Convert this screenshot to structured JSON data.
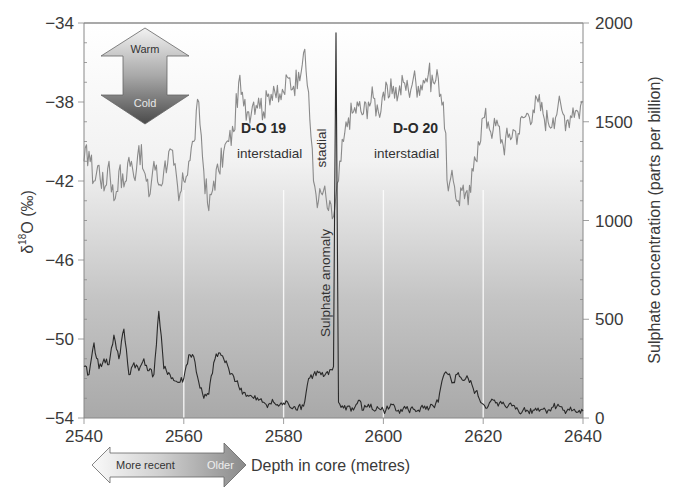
{
  "chart_data": {
    "type": "line",
    "title": "",
    "xlabel": "Depth in core (metres)",
    "ylabel": "δ18O (‰)",
    "ylabel_right": "Sulphate concentration (parts per billion)",
    "xlim": [
      2540,
      2640
    ],
    "ylim": [
      -54,
      -34
    ],
    "ylim_right": [
      0,
      2000
    ],
    "x_ticks": [
      2540,
      2560,
      2580,
      2600,
      2620,
      2640
    ],
    "y_ticks": [
      -34,
      -38,
      -42,
      -46,
      -50,
      -54
    ],
    "y_ticks_right": [
      0,
      500,
      1000,
      1500,
      2000
    ],
    "grid": "vertical white lines at 2560, 2580, 2600, 2620 (lower part)",
    "background": "vertical gradient white (top) to grey (bottom)",
    "series": [
      {
        "name": "δ18O",
        "axis": "left",
        "color": "#8a8a8a",
        "x": [
          2540,
          2541,
          2542,
          2543,
          2544,
          2545,
          2546,
          2547,
          2548,
          2549,
          2550,
          2551,
          2552,
          2553,
          2554,
          2555,
          2556,
          2557,
          2558,
          2559,
          2560,
          2561,
          2562,
          2563,
          2564,
          2565,
          2566,
          2567,
          2568,
          2569,
          2570,
          2571,
          2572,
          2573,
          2574,
          2575,
          2576,
          2577,
          2578,
          2579,
          2580,
          2581,
          2582,
          2583,
          2584,
          2585,
          2586,
          2587,
          2588,
          2589,
          2590,
          2591,
          2592,
          2593,
          2594,
          2595,
          2596,
          2597,
          2598,
          2599,
          2600,
          2601,
          2602,
          2603,
          2604,
          2605,
          2606,
          2607,
          2608,
          2609,
          2610,
          2611,
          2612,
          2613,
          2614,
          2615,
          2616,
          2617,
          2618,
          2619,
          2620,
          2621,
          2622,
          2623,
          2624,
          2625,
          2626,
          2627,
          2628,
          2629,
          2630,
          2631,
          2632,
          2633,
          2634,
          2635,
          2636,
          2637,
          2638,
          2639,
          2640
        ],
        "values": [
          -41.0,
          -40.5,
          -42.0,
          -41.2,
          -42.5,
          -41.0,
          -43.0,
          -41.5,
          -42.3,
          -40.8,
          -41.8,
          -40.2,
          -41.5,
          -42.8,
          -41.0,
          -42.2,
          -41.5,
          -40.5,
          -41.2,
          -43.0,
          -42.0,
          -41.0,
          -40.0,
          -38.0,
          -41.5,
          -43.5,
          -42.0,
          -41.5,
          -40.5,
          -40.0,
          -39.5,
          -37.0,
          -38.2,
          -38.5,
          -38.0,
          -37.8,
          -38.5,
          -37.6,
          -37.2,
          -38.0,
          -37.5,
          -36.8,
          -37.2,
          -36.5,
          -35.5,
          -37.5,
          -42.0,
          -43.0,
          -42.5,
          -43.5,
          -43.8,
          -42.0,
          -40.0,
          -38.8,
          -38.5,
          -38.2,
          -38.6,
          -38.0,
          -37.8,
          -38.5,
          -37.5,
          -37.8,
          -37.2,
          -37.6,
          -37.0,
          -37.4,
          -36.8,
          -37.2,
          -36.9,
          -36.6,
          -37.0,
          -36.8,
          -38.0,
          -42.5,
          -42.0,
          -43.0,
          -42.2,
          -43.2,
          -41.5,
          -40.0,
          -38.8,
          -39.0,
          -39.4,
          -39.2,
          -40.2,
          -39.8,
          -39.4,
          -39.6,
          -38.8,
          -38.6,
          -38.4,
          -38.0,
          -38.6,
          -39.0,
          -38.8,
          -38.2,
          -38.6,
          -38.9,
          -38.3,
          -38.5,
          -38.0
        ]
      },
      {
        "name": "Sulphate",
        "axis": "right",
        "color": "#2a2a2a",
        "x": [
          2540,
          2541,
          2542,
          2543,
          2544,
          2545,
          2546,
          2547,
          2548,
          2549,
          2550,
          2551,
          2552,
          2553,
          2554,
          2555,
          2556,
          2557,
          2558,
          2559,
          2560,
          2561,
          2562,
          2563,
          2564,
          2565,
          2566,
          2567,
          2568,
          2569,
          2570,
          2571,
          2572,
          2573,
          2574,
          2575,
          2576,
          2577,
          2578,
          2579,
          2580,
          2581,
          2582,
          2583,
          2584,
          2585,
          2586,
          2587,
          2588,
          2589,
          2590,
          2590.5,
          2591,
          2592,
          2593,
          2594,
          2595,
          2596,
          2597,
          2598,
          2599,
          2600,
          2601,
          2602,
          2603,
          2604,
          2605,
          2606,
          2607,
          2608,
          2609,
          2610,
          2611,
          2612,
          2613,
          2614,
          2615,
          2616,
          2617,
          2618,
          2619,
          2620,
          2621,
          2622,
          2623,
          2624,
          2625,
          2626,
          2627,
          2628,
          2629,
          2630,
          2631,
          2632,
          2633,
          2634,
          2635,
          2636,
          2637,
          2638,
          2639,
          2640
        ],
        "values": [
          260,
          220,
          380,
          250,
          300,
          270,
          420,
          300,
          450,
          220,
          280,
          240,
          300,
          240,
          220,
          540,
          250,
          230,
          190,
          180,
          200,
          320,
          310,
          180,
          100,
          120,
          280,
          330,
          300,
          250,
          210,
          160,
          130,
          110,
          100,
          90,
          80,
          70,
          80,
          60,
          75,
          70,
          55,
          60,
          60,
          200,
          220,
          230,
          210,
          220,
          260,
          1950,
          80,
          50,
          60,
          40,
          90,
          40,
          70,
          40,
          50,
          40,
          45,
          70,
          40,
          50,
          40,
          45,
          40,
          50,
          40,
          60,
          80,
          210,
          220,
          180,
          230,
          190,
          200,
          150,
          110,
          70,
          60,
          90,
          60,
          80,
          60,
          65,
          40,
          40,
          35,
          40,
          50,
          45,
          40,
          55,
          70,
          40,
          45,
          40,
          30,
          35
        ]
      }
    ],
    "annotations": [
      {
        "text": "D-O 19",
        "style": "bold",
        "x": 2575,
        "y": -39.2
      },
      {
        "text": "interstadial",
        "x": 2571,
        "y": -41.4
      },
      {
        "text": "stadial",
        "orientation": "vertical",
        "x": 2587,
        "y": -40
      },
      {
        "text": "D-O 20",
        "style": "bold",
        "x": 2603,
        "y": -39.2
      },
      {
        "text": "interstadial",
        "x": 2599,
        "y": -41.4
      },
      {
        "text": "Sulphate anomaly",
        "orientation": "vertical",
        "x": 2588.5,
        "y": -48.5
      }
    ]
  },
  "legend": {
    "temp_arrow": {
      "up_label": "Warm",
      "down_label": "Cold"
    },
    "depth_arrow": {
      "left_label": "More recent",
      "right_label": "Older"
    }
  },
  "labels": {
    "y_left_symbol": "δ",
    "y_left_sup": "18",
    "y_left_rest": "O (‰)",
    "x_title": "Depth in core (metres)",
    "y_right_title": "Sulphate concentration (parts per billion)",
    "do19_title": "D-O 19",
    "do19_sub": "interstadial",
    "stadial": "stadial",
    "do20_title": "D-O 20",
    "do20_sub": "interstadial",
    "sulphate_anomaly": "Sulphate anomaly",
    "x_ticks": [
      "2540",
      "2560",
      "2580",
      "2600",
      "2620",
      "2640"
    ],
    "y_ticks": [
      "−34",
      "−38",
      "−42",
      "−46",
      "−50",
      "−54"
    ],
    "y_ticks_right": [
      "2000",
      "1500",
      "1000",
      "500",
      "0"
    ]
  }
}
